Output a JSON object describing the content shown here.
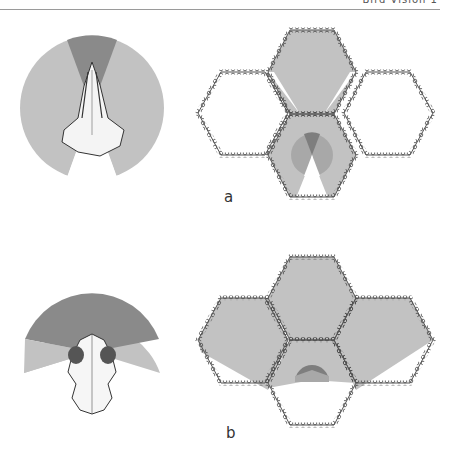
{
  "header": {
    "text": "Bird Vision  1"
  },
  "colors": {
    "dark_sector": "#8a8a8a",
    "light_sector": "#c2c2c2",
    "blind": "#ffffff",
    "hex_outline": "#3a3a3a"
  },
  "panels": [
    {
      "label": "a",
      "description": "Lateral-eyed skull (narrow binocular field, wide panoramic view) and honeycomb coverage"
    },
    {
      "label": "b",
      "description": "Frontal-eyed skull (wide binocular field) and honeycomb coverage"
    }
  ]
}
